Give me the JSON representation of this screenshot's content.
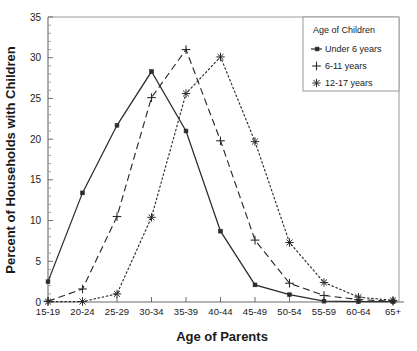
{
  "chart_data": {
    "type": "line",
    "title": "",
    "subtitle": "",
    "xlabel": "Age of Parents",
    "ylabel": "Percent of Households with Children",
    "categories": [
      "15-19",
      "20-24",
      "25-29",
      "30-34",
      "35-39",
      "40-44",
      "45-49",
      "50-54",
      "55-59",
      "60-64",
      "65+"
    ],
    "ylim": [
      0,
      35
    ],
    "yticks": [
      0,
      5,
      10,
      15,
      20,
      25,
      30,
      35
    ],
    "ytick_labels": [
      "0",
      "5",
      "10",
      "15",
      "20",
      "25",
      "30",
      "35"
    ],
    "y_minor_tick_step": 1,
    "grid": false,
    "legend_position": "top-right",
    "legend_title": "Age of Children",
    "series": [
      {
        "name": "Under 6 years",
        "marker": "square",
        "linestyle": "solid",
        "color": "#2b2b2b",
        "values": [
          2.5,
          13.4,
          21.7,
          28.3,
          21.0,
          8.7,
          2.1,
          0.9,
          0.1,
          0.05,
          0.05
        ]
      },
      {
        "name": "6-11 years",
        "marker": "plus",
        "linestyle": "dashed",
        "color": "#2b2b2b",
        "values": [
          0.1,
          1.6,
          10.5,
          25.1,
          31.0,
          19.8,
          7.6,
          2.3,
          0.8,
          0.3,
          0.1
        ]
      },
      {
        "name": "12-17 years",
        "marker": "asterisk",
        "linestyle": "dotted",
        "color": "#2b2b2b",
        "values": [
          0.05,
          0.05,
          1.0,
          10.4,
          25.6,
          30.1,
          19.7,
          7.3,
          2.4,
          0.6,
          0.2
        ]
      }
    ]
  },
  "axes": {
    "x_title": "Age of Parents",
    "y_title": "Percent of Households with Children"
  },
  "legend": {
    "title": "Age of Children",
    "entries": [
      {
        "label": "Under 6 years",
        "marker": "square-line-marker"
      },
      {
        "label": "6-11 years",
        "marker": "plus-marker"
      },
      {
        "label": "12-17 years",
        "marker": "asterisk-marker"
      }
    ]
  },
  "colors": {
    "ink": "#2b2b2b",
    "frame": "#9a9a9a",
    "axis": "#6b6b6b",
    "background": "#ffffff"
  }
}
